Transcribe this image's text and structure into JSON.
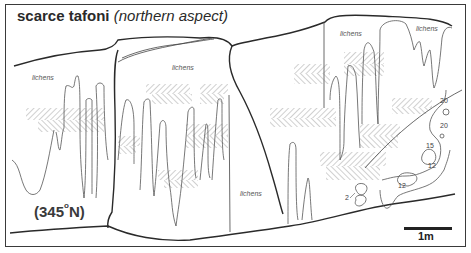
{
  "title": {
    "bold": "scarce tafoni",
    "italic": "(northern aspect)"
  },
  "labels": {
    "lichens_1": "lichens",
    "lichens_2": "lichens",
    "lichens_3": "lichens",
    "lichens_4": "lichens",
    "lichens_5": "lichens"
  },
  "contour_values": {
    "c20a": "20",
    "c20b": "20",
    "c15": "15",
    "c12a": "12",
    "c12b": "12",
    "c2": "2"
  },
  "aspect": {
    "value": "(345",
    "degree": "o",
    "suffix": "N)"
  },
  "scale": {
    "label": "1m"
  },
  "colors": {
    "line": "#3a3a3a",
    "hatch": "#6a6a6a",
    "background": "#ffffff"
  }
}
